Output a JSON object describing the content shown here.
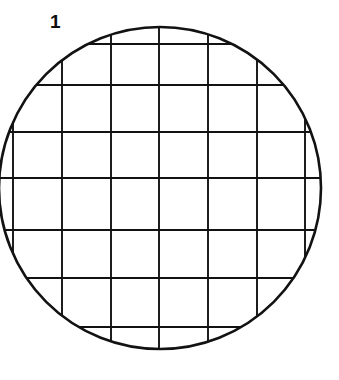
{
  "figure": {
    "label": "1",
    "caption_number": "1",
    "background_color": "#ffffff",
    "stroke_color": "#121212",
    "circle": {
      "center_x": 160,
      "center_y": 188,
      "radius": 161,
      "outline_width": 2.6
    },
    "grid": {
      "line_width": 1.9,
      "vertical_lines_x": [
        13,
        62,
        111,
        159,
        208,
        257,
        305
      ],
      "horizontal_lines_y": [
        44,
        85,
        132,
        178,
        230,
        278,
        327
      ],
      "vertical_count": 7,
      "horizontal_count": 7,
      "vertical_spacing": 48.7,
      "horizontal_spacing": 47.2
    }
  }
}
